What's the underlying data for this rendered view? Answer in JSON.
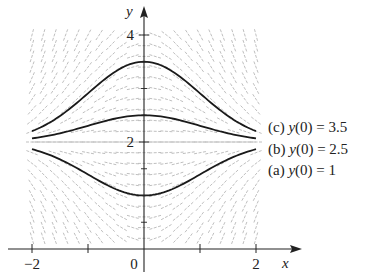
{
  "diagram": {
    "type": "slope-field",
    "equation_form": "dy/dx = -x(y - 2)",
    "axes": {
      "x_label": "x",
      "y_label": "y",
      "x_ticks": [
        {
          "value": -2,
          "label": "-2"
        },
        {
          "value": -1,
          "label": ""
        },
        {
          "value": 0,
          "label": "0"
        },
        {
          "value": 1,
          "label": ""
        },
        {
          "value": 2,
          "label": "2"
        }
      ],
      "y_ticks": [
        {
          "value": 2,
          "label": "2"
        },
        {
          "value": 4,
          "label": "4"
        }
      ],
      "xlim": [
        -2,
        2
      ],
      "ylim": [
        0,
        4.4
      ]
    },
    "equilibrium": {
      "y": 2
    },
    "solutions": [
      {
        "id": "c",
        "label": "(c) y(0) = 3.5",
        "y0": 3.5
      },
      {
        "id": "b",
        "label": "(b) y(0) = 2.5",
        "y0": 2.5
      },
      {
        "id": "a",
        "label": "(a) y(0) = 1",
        "y0": 1
      }
    ],
    "colors": {
      "curve": "#1a1a1a",
      "field": "#b8b8b8",
      "axis": "#222222",
      "text": "#222222"
    }
  }
}
